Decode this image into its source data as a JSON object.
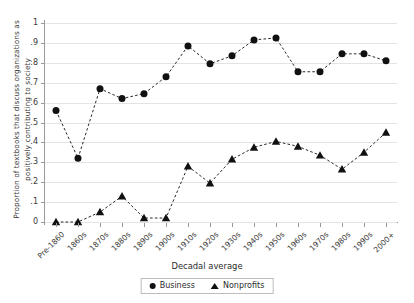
{
  "chart_data": {
    "type": "line",
    "title": "",
    "xlabel": "Decadal average",
    "ylabel": "Proportion of textbooks that discuss organizations as positively contributing to society",
    "categories": [
      "Pre-1860",
      "1860s",
      "1870s",
      "1880s",
      "1890s",
      "1900s",
      "1910s",
      "1920s",
      "1930s",
      "1940s",
      "1950s",
      "1960s",
      "1970s",
      "1980s",
      "1990s",
      "2000+"
    ],
    "ylim": [
      0,
      1
    ],
    "yticks": [
      0,
      0.1,
      0.2,
      0.3,
      0.4,
      0.5,
      0.6,
      0.7,
      0.8,
      0.9,
      1
    ],
    "ytick_labels": [
      "0",
      ".1",
      ".2",
      ".3",
      ".4",
      ".5",
      ".6",
      ".7",
      ".8",
      ".9",
      "1"
    ],
    "grid": "horizontal",
    "legend_position": "bottom-center",
    "series": [
      {
        "name": "Business",
        "marker": "circle",
        "line_style": "dashed",
        "color": "#111111",
        "values": [
          0.56,
          0.32,
          0.67,
          0.62,
          0.645,
          0.73,
          0.885,
          0.795,
          0.835,
          0.915,
          0.925,
          0.755,
          0.755,
          0.845,
          0.845,
          0.81
        ]
      },
      {
        "name": "Nonprofits",
        "marker": "triangle",
        "line_style": "dashed",
        "color": "#111111",
        "values": [
          0.0,
          0.0,
          0.05,
          0.13,
          0.02,
          0.02,
          0.28,
          0.195,
          0.315,
          0.375,
          0.405,
          0.38,
          0.335,
          0.265,
          0.35,
          0.45
        ]
      }
    ]
  },
  "legend": {
    "items": [
      {
        "label": "Business",
        "marker": "circle-marker"
      },
      {
        "label": "Nonprofits",
        "marker": "triangle-marker"
      }
    ]
  }
}
